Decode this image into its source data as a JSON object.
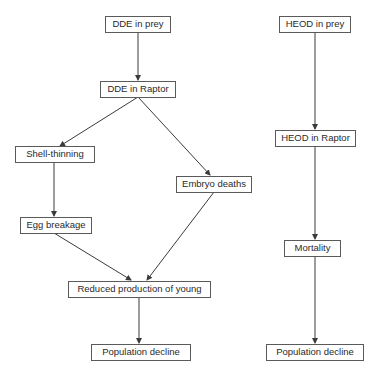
{
  "diagram": {
    "left_flow": {
      "nodes": [
        {
          "id": "dde_prey",
          "label": "DDE in prey"
        },
        {
          "id": "dde_raptor",
          "label": "DDE in Raptor"
        },
        {
          "id": "shell_thinning",
          "label": "Shell-thinning"
        },
        {
          "id": "embryo_deaths",
          "label": "Embryo deaths"
        },
        {
          "id": "egg_breakage",
          "label": "Egg breakage"
        },
        {
          "id": "reduced_production",
          "label": "Reduced production of young"
        },
        {
          "id": "population_decline_left",
          "label": "Population decline"
        }
      ],
      "edges": [
        [
          "dde_prey",
          "dde_raptor"
        ],
        [
          "dde_raptor",
          "shell_thinning"
        ],
        [
          "dde_raptor",
          "embryo_deaths"
        ],
        [
          "shell_thinning",
          "egg_breakage"
        ],
        [
          "egg_breakage",
          "reduced_production"
        ],
        [
          "embryo_deaths",
          "reduced_production"
        ],
        [
          "reduced_production",
          "population_decline_left"
        ]
      ]
    },
    "right_flow": {
      "nodes": [
        {
          "id": "heod_prey",
          "label": "HEOD in prey"
        },
        {
          "id": "heod_raptor",
          "label": "HEOD in Raptor"
        },
        {
          "id": "mortality",
          "label": "Mortality"
        },
        {
          "id": "population_decline_right",
          "label": "Population decline"
        }
      ],
      "edges": [
        [
          "heod_prey",
          "heod_raptor"
        ],
        [
          "heod_raptor",
          "mortality"
        ],
        [
          "mortality",
          "population_decline_right"
        ]
      ]
    },
    "colors": {
      "line": "#3a3a3a",
      "box_border": "#5a5a5a",
      "text": "#2a2a2a",
      "background": "#ffffff"
    }
  }
}
